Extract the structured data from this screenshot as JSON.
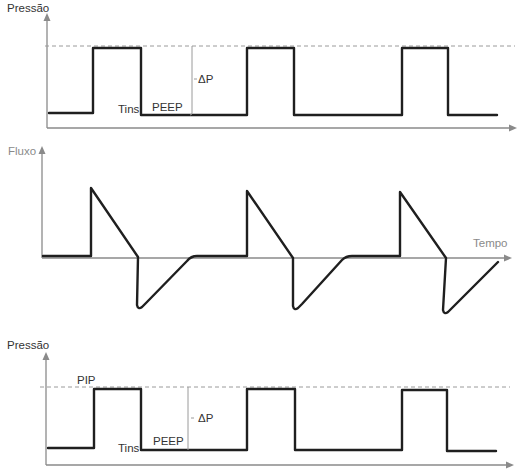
{
  "colors": {
    "waveform": "#1f1f1f",
    "axis": "#8a8a8a",
    "reference_dashed_line": "#9a9a9a",
    "label_text": "#333333",
    "muted_label_text": "#8a8a8a",
    "background": "#ffffff"
  },
  "pressure_top": {
    "ylabel": "Pressão",
    "delta_p_label": "ΔP",
    "tins_label": "Tins",
    "peep_label": "PEEP",
    "waveform_points": "49,113 93,113 93,48 141,48 141,115 247,115 247,48 294,48 294,115 402,115 402,48 448,48 448,115 497,115",
    "peak_reference_line": "M45,46 L515,46",
    "delta_p_marker": "M192,46 L192,113 Q192,115 190,115",
    "delta_p_tick": "M194,79 L197,79"
  },
  "flow": {
    "ylabel": "Fluxo",
    "xlabel": "Tempo",
    "waveform_path": "M43,256 L91,256 L91,188 L138,257 L137,305 Q138,310 142,307 L146,303 L187,261 Q191,256 197,256 L247,256 L247,191 L293,258 L293,306 Q294,311 298,308 L302,304 L342,260 Q346,256 352,256 L400,256 L400,192 L446,258 L443,310 Q444,315 448,312 L498,262"
  },
  "pressure_bottom": {
    "ylabel": "Pressão",
    "pip_label": "PIP",
    "delta_p_label": "ΔP",
    "tins_label": "Tins",
    "peep_label": "PEEP",
    "waveform_points": "48,448 94,448 94,389 141,389 141,450 247,450 247,389 295,389 295,450 402,450 402,390 447,390 447,451 496,451",
    "peak_reference_line": "M40,387 L510,387",
    "delta_p_marker": "M188,387 L188,450",
    "delta_p_tick": "M191,418 L194,418"
  }
}
